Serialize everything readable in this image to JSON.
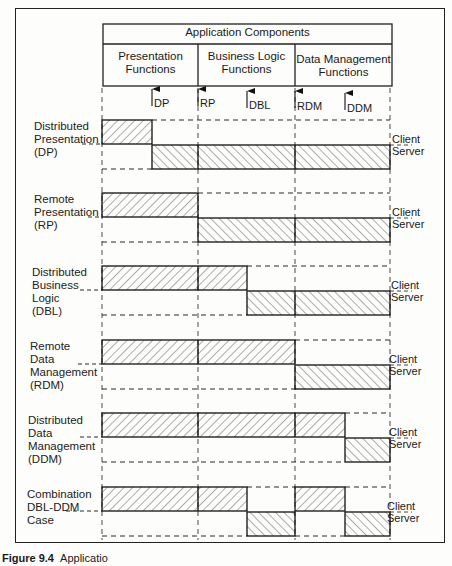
{
  "header": {
    "title": "Application Components",
    "columns": [
      {
        "label": "Presentation Functions",
        "line1": "Presentation",
        "line2": "Functions"
      },
      {
        "label": "Business Logic Functions",
        "line1": "Business Logic",
        "line2": "Functions"
      },
      {
        "label": "Data Management Functions",
        "line1": "Data Management",
        "line2": "Functions"
      }
    ]
  },
  "split_points": [
    {
      "abbr": "DP"
    },
    {
      "abbr": "RP"
    },
    {
      "abbr": "DBL"
    },
    {
      "abbr": "RDM"
    },
    {
      "abbr": "DDM"
    }
  ],
  "rows": [
    {
      "lines": [
        "Distributed",
        "Presentation",
        "(DP)"
      ],
      "client_label": "Client",
      "server_label": "Server"
    },
    {
      "lines": [
        "Remote",
        "Presentation",
        "(RP)"
      ],
      "client_label": "Client",
      "server_label": "Server"
    },
    {
      "lines": [
        "Distributed",
        "Business",
        "Logic",
        "(DBL)"
      ],
      "client_label": "Client",
      "server_label": "Server"
    },
    {
      "lines": [
        "Remote",
        "Data",
        "Management",
        "(RDM)"
      ],
      "client_label": "Client",
      "server_label": "Server"
    },
    {
      "lines": [
        "Distributed",
        "Data",
        "Management",
        "(DDM)"
      ],
      "client_label": "Client",
      "server_label": "Server"
    },
    {
      "lines": [
        "Combination",
        "DBL-DDM",
        "Case"
      ],
      "client_label": "Client",
      "server_label": "Server"
    }
  ],
  "caption": {
    "figure": "Figure 9.4",
    "text": "Applicatio"
  }
}
